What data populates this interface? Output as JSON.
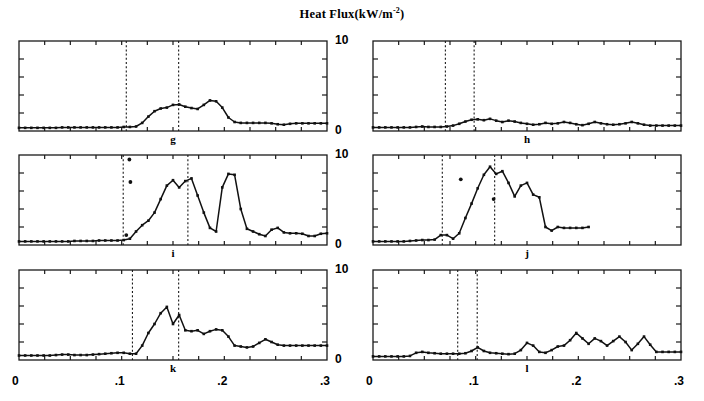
{
  "figure": {
    "title_main": "Heat Flux(kW/m",
    "title_sup": "-2",
    "title_close": ")",
    "y_axis": {
      "min_label": "0",
      "max_label": "10",
      "ticks": [
        0,
        2,
        4,
        6,
        8,
        10
      ]
    },
    "x_axis": {
      "labels": [
        "0",
        ".1",
        ".2",
        ".3"
      ],
      "values": [
        0,
        0.1,
        0.2,
        0.3
      ]
    }
  },
  "chart_data": {
    "type": "line",
    "title": "Heat Flux(kW/m-2)",
    "xlabel": "",
    "ylabel": "Heat Flux (kW/m^-2)",
    "xlim": [
      0,
      0.3
    ],
    "ylim": [
      0,
      10
    ],
    "grid": false,
    "legend": "none",
    "panels": [
      {
        "label": "g",
        "row": 0,
        "col": 0,
        "markers_x": [],
        "vlines": [
          0.1045,
          0.1555
        ],
        "x": [
          0.0,
          0.006,
          0.012,
          0.018,
          0.024,
          0.03,
          0.036,
          0.042,
          0.048,
          0.054,
          0.06,
          0.066,
          0.072,
          0.078,
          0.084,
          0.09,
          0.096,
          0.102,
          0.108,
          0.114,
          0.12,
          0.126,
          0.132,
          0.138,
          0.144,
          0.15,
          0.156,
          0.162,
          0.168,
          0.174,
          0.18,
          0.186,
          0.192,
          0.198,
          0.204,
          0.21,
          0.216,
          0.222,
          0.228,
          0.234,
          0.24,
          0.246,
          0.252,
          0.258,
          0.264,
          0.27,
          0.276,
          0.282,
          0.288,
          0.294,
          0.3
        ],
        "y": [
          0.35,
          0.35,
          0.35,
          0.35,
          0.35,
          0.35,
          0.35,
          0.4,
          0.4,
          0.4,
          0.4,
          0.4,
          0.4,
          0.4,
          0.4,
          0.4,
          0.4,
          0.45,
          0.45,
          0.5,
          0.9,
          1.6,
          2.2,
          2.5,
          2.6,
          2.9,
          2.95,
          2.7,
          2.55,
          2.45,
          2.9,
          3.4,
          3.3,
          2.6,
          1.5,
          1.0,
          0.9,
          0.9,
          0.9,
          0.9,
          0.9,
          0.85,
          0.75,
          0.7,
          0.8,
          0.85,
          0.85,
          0.85,
          0.85,
          0.85,
          0.85
        ]
      },
      {
        "label": "h",
        "row": 0,
        "col": 1,
        "markers_x": [],
        "vlines": [
          0.0705,
          0.0985
        ],
        "x": [
          0.0,
          0.006,
          0.012,
          0.018,
          0.024,
          0.03,
          0.036,
          0.042,
          0.048,
          0.054,
          0.06,
          0.066,
          0.072,
          0.078,
          0.084,
          0.09,
          0.096,
          0.102,
          0.108,
          0.114,
          0.12,
          0.126,
          0.132,
          0.138,
          0.144,
          0.15,
          0.156,
          0.162,
          0.168,
          0.174,
          0.18,
          0.186,
          0.192,
          0.198,
          0.204,
          0.21,
          0.216,
          0.222,
          0.228,
          0.234,
          0.24,
          0.246,
          0.252,
          0.258,
          0.264,
          0.27,
          0.276,
          0.282,
          0.288,
          0.294,
          0.3
        ],
        "y": [
          0.4,
          0.4,
          0.4,
          0.4,
          0.4,
          0.4,
          0.4,
          0.45,
          0.5,
          0.45,
          0.45,
          0.45,
          0.5,
          0.6,
          0.8,
          1.05,
          1.25,
          1.3,
          1.2,
          1.35,
          1.15,
          1.0,
          1.15,
          1.05,
          0.9,
          0.8,
          0.7,
          0.75,
          0.9,
          0.8,
          0.85,
          1.0,
          0.9,
          0.75,
          0.65,
          0.8,
          1.0,
          0.85,
          0.75,
          0.7,
          0.75,
          0.85,
          1.0,
          0.85,
          0.7,
          0.6,
          0.6,
          0.6,
          0.6,
          0.6,
          0.6
        ]
      },
      {
        "label": "i",
        "row": 1,
        "col": 0,
        "markers_x": [
          0.1075,
          0.1085,
          0.1045
        ],
        "markers_y": [
          9.5,
          7.0,
          1.1
        ],
        "vlines": [
          0.1015,
          0.1645
        ],
        "x": [
          0.0,
          0.006,
          0.012,
          0.018,
          0.024,
          0.03,
          0.036,
          0.042,
          0.048,
          0.054,
          0.06,
          0.066,
          0.072,
          0.078,
          0.084,
          0.09,
          0.096,
          0.102,
          0.108,
          0.114,
          0.12,
          0.126,
          0.132,
          0.138,
          0.144,
          0.15,
          0.156,
          0.162,
          0.168,
          0.174,
          0.18,
          0.186,
          0.192,
          0.198,
          0.204,
          0.21,
          0.216,
          0.222,
          0.228,
          0.234,
          0.24,
          0.246,
          0.252,
          0.258,
          0.264,
          0.27,
          0.276,
          0.282,
          0.288,
          0.294,
          0.3
        ],
        "y": [
          0.4,
          0.4,
          0.4,
          0.4,
          0.4,
          0.4,
          0.4,
          0.4,
          0.4,
          0.45,
          0.45,
          0.45,
          0.45,
          0.5,
          0.5,
          0.5,
          0.5,
          0.55,
          0.7,
          1.5,
          2.2,
          2.7,
          3.6,
          5.1,
          6.6,
          7.2,
          6.4,
          7.1,
          7.4,
          5.5,
          3.6,
          1.9,
          1.5,
          6.4,
          7.9,
          7.8,
          4.0,
          1.8,
          1.5,
          1.2,
          1.0,
          1.7,
          1.9,
          1.4,
          1.3,
          1.3,
          1.25,
          1.0,
          1.0,
          1.25,
          1.3
        ]
      },
      {
        "label": "j",
        "row": 1,
        "col": 1,
        "markers_x": [
          0.0855,
          0.1175
        ],
        "markers_y": [
          7.3,
          5.1
        ],
        "vlines": [
          0.0675,
          0.1185
        ],
        "x": [
          0.0,
          0.006,
          0.012,
          0.018,
          0.024,
          0.03,
          0.036,
          0.042,
          0.048,
          0.054,
          0.06,
          0.066,
          0.072,
          0.078,
          0.084,
          0.09,
          0.096,
          0.102,
          0.108,
          0.114,
          0.12,
          0.126,
          0.132,
          0.138,
          0.144,
          0.15,
          0.156,
          0.162,
          0.168,
          0.174,
          0.18,
          0.186,
          0.192,
          0.198,
          0.204,
          0.21
        ],
        "y": [
          0.4,
          0.4,
          0.4,
          0.4,
          0.4,
          0.4,
          0.45,
          0.5,
          0.55,
          0.55,
          0.6,
          1.1,
          1.1,
          0.7,
          1.3,
          3.0,
          4.6,
          6.3,
          7.8,
          8.7,
          7.9,
          8.2,
          6.9,
          5.4,
          6.6,
          6.9,
          5.6,
          5.3,
          2.0,
          1.6,
          2.0,
          1.9,
          1.9,
          1.9,
          1.9,
          2.0
        ]
      },
      {
        "label": "k",
        "row": 2,
        "col": 0,
        "markers_x": [],
        "vlines": [
          0.1105,
          0.1555
        ],
        "x": [
          0.0,
          0.006,
          0.012,
          0.018,
          0.024,
          0.03,
          0.036,
          0.042,
          0.048,
          0.054,
          0.06,
          0.066,
          0.072,
          0.078,
          0.084,
          0.09,
          0.096,
          0.102,
          0.108,
          0.114,
          0.12,
          0.126,
          0.132,
          0.138,
          0.144,
          0.15,
          0.156,
          0.162,
          0.168,
          0.174,
          0.18,
          0.186,
          0.192,
          0.198,
          0.204,
          0.21,
          0.216,
          0.222,
          0.228,
          0.234,
          0.24,
          0.246,
          0.252,
          0.258,
          0.264,
          0.27,
          0.276,
          0.282,
          0.288,
          0.294,
          0.3
        ],
        "y": [
          0.5,
          0.5,
          0.5,
          0.5,
          0.5,
          0.5,
          0.55,
          0.6,
          0.6,
          0.55,
          0.55,
          0.55,
          0.6,
          0.65,
          0.7,
          0.75,
          0.8,
          0.8,
          0.7,
          0.7,
          1.6,
          3.0,
          4.0,
          5.2,
          5.9,
          4.0,
          5.0,
          3.3,
          3.2,
          3.3,
          2.9,
          3.2,
          3.4,
          3.3,
          2.6,
          1.6,
          1.5,
          1.4,
          1.5,
          1.9,
          2.3,
          2.0,
          1.7,
          1.6,
          1.6,
          1.6,
          1.6,
          1.6,
          1.6,
          1.6,
          1.6
        ]
      },
      {
        "label": "l",
        "row": 2,
        "col": 1,
        "markers_x": [],
        "vlines": [
          0.0825,
          0.1015
        ],
        "x": [
          0.0,
          0.006,
          0.012,
          0.018,
          0.024,
          0.03,
          0.036,
          0.042,
          0.048,
          0.054,
          0.06,
          0.066,
          0.072,
          0.078,
          0.084,
          0.09,
          0.096,
          0.102,
          0.108,
          0.114,
          0.12,
          0.126,
          0.132,
          0.138,
          0.144,
          0.15,
          0.156,
          0.162,
          0.168,
          0.174,
          0.18,
          0.186,
          0.192,
          0.198,
          0.204,
          0.21,
          0.216,
          0.222,
          0.228,
          0.234,
          0.24,
          0.246,
          0.252,
          0.258,
          0.264,
          0.27,
          0.276,
          0.282,
          0.288,
          0.294,
          0.3
        ],
        "y": [
          0.4,
          0.4,
          0.4,
          0.4,
          0.4,
          0.4,
          0.45,
          0.8,
          0.9,
          0.8,
          0.75,
          0.7,
          0.7,
          0.7,
          0.7,
          0.75,
          1.0,
          1.4,
          1.0,
          0.8,
          0.75,
          0.7,
          0.65,
          0.7,
          1.1,
          1.9,
          1.6,
          0.9,
          0.8,
          1.1,
          1.5,
          1.6,
          2.2,
          3.0,
          2.4,
          1.8,
          2.4,
          2.1,
          1.6,
          2.1,
          2.6,
          2.0,
          1.1,
          1.8,
          2.6,
          1.7,
          0.9,
          0.9,
          0.9,
          0.9,
          0.9
        ]
      }
    ]
  }
}
